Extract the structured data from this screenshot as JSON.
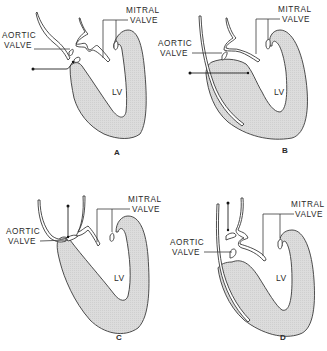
{
  "figure": {
    "colors": {
      "line": "#3a3a3a",
      "wall_fill": "#d9d9d9",
      "background": "#ffffff"
    }
  },
  "panels": [
    {
      "id": "A",
      "letter": "A",
      "lv_label": "LV",
      "mitral_label_1": "MITRAL",
      "mitral_label_2": "VALVE",
      "aortic_label_1": "AORTIC",
      "aortic_label_2": "VALVE"
    },
    {
      "id": "B",
      "letter": "B",
      "lv_label": "LV",
      "mitral_label_1": "MITRAL",
      "mitral_label_2": "VALVE",
      "aortic_label_1": "AORTIC",
      "aortic_label_2": "VALVE"
    },
    {
      "id": "C",
      "letter": "C",
      "lv_label": "LV",
      "mitral_label_1": "MITRAL",
      "mitral_label_2": "VALVE",
      "aortic_label_1": "AORTIC",
      "aortic_label_2": "VALVE"
    },
    {
      "id": "D",
      "letter": "D",
      "lv_label": "LV",
      "mitral_label_1": "MITRAL",
      "mitral_label_2": "VALVE",
      "aortic_label_1": "AORTIC",
      "aortic_label_2": "VALVE"
    }
  ]
}
